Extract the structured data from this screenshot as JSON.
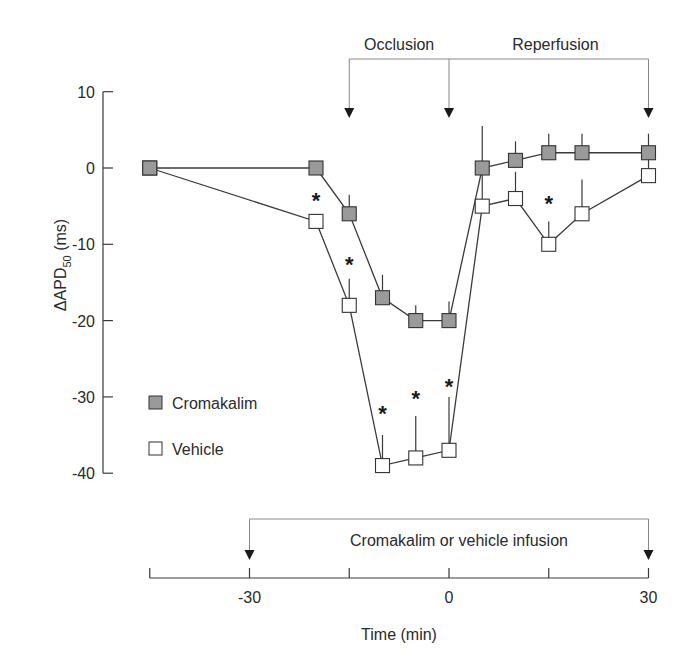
{
  "chart_data": {
    "type": "line",
    "title": "",
    "xlabel": "Time (min)",
    "ylabel": "ΔAPD50 (ms)",
    "ylabel_main": "ΔAPD",
    "ylabel_sub": "50",
    "ylabel_unit": "(ms)",
    "xlim": [
      -45,
      30
    ],
    "ylim": [
      -40,
      10
    ],
    "x_ticks": [
      -45,
      -30,
      -15,
      0,
      15,
      30
    ],
    "x_tick_labels": [
      "",
      "-30",
      "",
      "0",
      "",
      "30"
    ],
    "y_ticks": [
      10,
      0,
      -10,
      -20,
      -30,
      -40
    ],
    "y_tick_labels": [
      "10",
      "0",
      "-10",
      "-20",
      "-30",
      "-40"
    ],
    "grid": false,
    "legend_position": "lower-left inside",
    "series": [
      {
        "name": "Cromakalim",
        "marker": "filled-gray-square",
        "color": "#9a9a9a",
        "x": [
          -45,
          -20,
          -15,
          -10,
          -5,
          0,
          5,
          10,
          15,
          20,
          30
        ],
        "values": [
          0,
          0,
          -6,
          -17,
          -20,
          -20,
          0,
          1,
          2,
          2,
          2
        ],
        "error_top": [
          null,
          null,
          -3.5,
          -14,
          -18,
          -17.5,
          5.5,
          3.5,
          4.5,
          4.5,
          4.5
        ]
      },
      {
        "name": "Vehicle",
        "marker": "open-square",
        "color": "#ffffff",
        "x": [
          -45,
          -20,
          -15,
          -10,
          -5,
          0,
          5,
          10,
          15,
          20,
          30
        ],
        "values": [
          0,
          -7,
          -18,
          -39,
          -38,
          -37,
          -5,
          -4,
          -10,
          -6,
          -1
        ],
        "error_top": [
          null,
          null,
          -14.5,
          -35,
          -32.5,
          -30,
          0,
          -0.5,
          -7,
          -1.5,
          2
        ]
      }
    ],
    "significance_markers": [
      {
        "x": -20,
        "y": -4,
        "symbol": "*"
      },
      {
        "x": -15,
        "y": -12.5,
        "symbol": "*"
      },
      {
        "x": -10,
        "y": -32,
        "symbol": "*"
      },
      {
        "x": -5,
        "y": -30,
        "symbol": "*"
      },
      {
        "x": 0,
        "y": -28.5,
        "symbol": "*"
      },
      {
        "x": 15,
        "y": -4.5,
        "symbol": "*"
      }
    ],
    "annotations": [
      {
        "text": "Occlusion",
        "from_x": -15,
        "to_x": 0,
        "type": "bracket-arrows-top"
      },
      {
        "text": "Reperfusion",
        "from_x": 0,
        "to_x": 30,
        "type": "bracket-arrows-top"
      },
      {
        "text": "Cromakalim or vehicle infusion",
        "from_x": -30,
        "to_x": 30,
        "type": "bracket-arrows-bottom"
      }
    ]
  },
  "labels": {
    "occlusion": "Occlusion",
    "reperfusion": "Reperfusion",
    "infusion": "Cromakalim or vehicle infusion",
    "legend_cromakalim": "Cromakalim",
    "legend_vehicle": "Vehicle",
    "ylabel_main": "ΔAPD",
    "ylabel_sub": "50",
    "ylabel_unit": " (ms)",
    "xlabel": "Time (min)"
  }
}
